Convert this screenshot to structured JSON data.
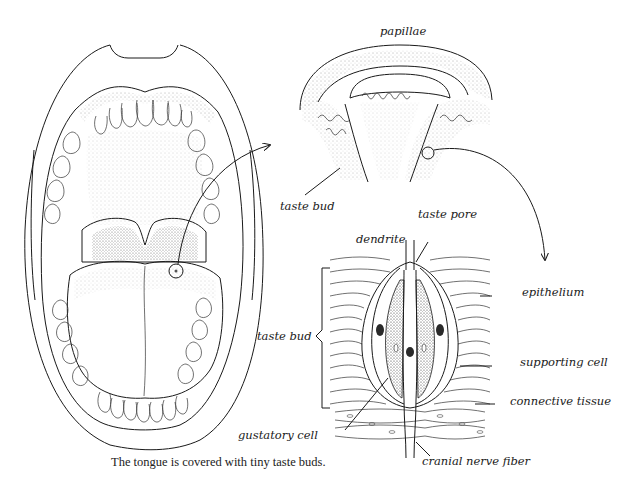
{
  "figure": {
    "caption": "The tongue is covered with tiny taste buds.",
    "panels": [
      {
        "name": "open-mouth",
        "description": "Open mouth showing teeth, palate, uvula and tongue with a circled region"
      },
      {
        "name": "papillae-detail",
        "description": "Cross-section of papillae with taste buds"
      },
      {
        "name": "taste-bud-detail",
        "description": "Cross-section of a single taste bud in epithelium"
      }
    ],
    "labels": {
      "papillae": "papillae",
      "taste_bud_top": "taste bud",
      "taste_pore": "taste pore",
      "dendrite": "dendrite",
      "epithelium": "epithelium",
      "taste_bud_side": "taste bud",
      "supporting_cell": "supporting cell",
      "connective_tissue": "connective tissue",
      "gustatory_cell": "gustatory cell",
      "cranial_nerve_fiber": "cranial nerve fiber"
    },
    "colors": {
      "ink": "#1a1a1a",
      "background": "#ffffff"
    }
  }
}
